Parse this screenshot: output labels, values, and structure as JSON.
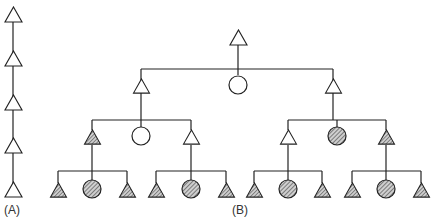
{
  "labels": {
    "a": "(A)",
    "b": "(B)"
  },
  "legend_semantics": {
    "triangle": "male",
    "circle": "female",
    "hatched": "affected",
    "open": "unaffected"
  },
  "diagram_a": {
    "type": "vertical-chain",
    "nodes": [
      {
        "shape": "triangle",
        "fill": "open"
      },
      {
        "shape": "triangle",
        "fill": "open"
      },
      {
        "shape": "triangle",
        "fill": "open"
      },
      {
        "shape": "triangle",
        "fill": "open"
      },
      {
        "shape": "triangle",
        "fill": "open"
      }
    ]
  },
  "diagram_b": {
    "root": {
      "shape": "triangle",
      "fill": "open"
    },
    "level1": [
      {
        "shape": "triangle",
        "fill": "open"
      },
      {
        "shape": "circle",
        "fill": "open"
      },
      {
        "shape": "triangle",
        "fill": "open"
      }
    ],
    "level2_left": [
      {
        "shape": "triangle",
        "fill": "hatched"
      },
      {
        "shape": "circle",
        "fill": "open"
      },
      {
        "shape": "triangle",
        "fill": "open"
      }
    ],
    "level2_right": [
      {
        "shape": "triangle",
        "fill": "open"
      },
      {
        "shape": "circle",
        "fill": "hatched"
      },
      {
        "shape": "triangle",
        "fill": "hatched"
      }
    ],
    "level3": [
      [
        {
          "shape": "triangle",
          "fill": "hatched"
        },
        {
          "shape": "circle",
          "fill": "hatched"
        },
        {
          "shape": "triangle",
          "fill": "hatched"
        }
      ],
      [
        {
          "shape": "triangle",
          "fill": "hatched"
        },
        {
          "shape": "circle",
          "fill": "hatched"
        },
        {
          "shape": "triangle",
          "fill": "hatched"
        }
      ],
      [
        {
          "shape": "triangle",
          "fill": "hatched"
        },
        {
          "shape": "circle",
          "fill": "hatched"
        },
        {
          "shape": "triangle",
          "fill": "hatched"
        }
      ],
      [
        {
          "shape": "triangle",
          "fill": "hatched"
        },
        {
          "shape": "circle",
          "fill": "hatched"
        },
        {
          "shape": "triangle",
          "fill": "hatched"
        }
      ]
    ]
  },
  "colors": {
    "stroke": "#222222",
    "hatch": "#555555",
    "background": "#ffffff"
  }
}
